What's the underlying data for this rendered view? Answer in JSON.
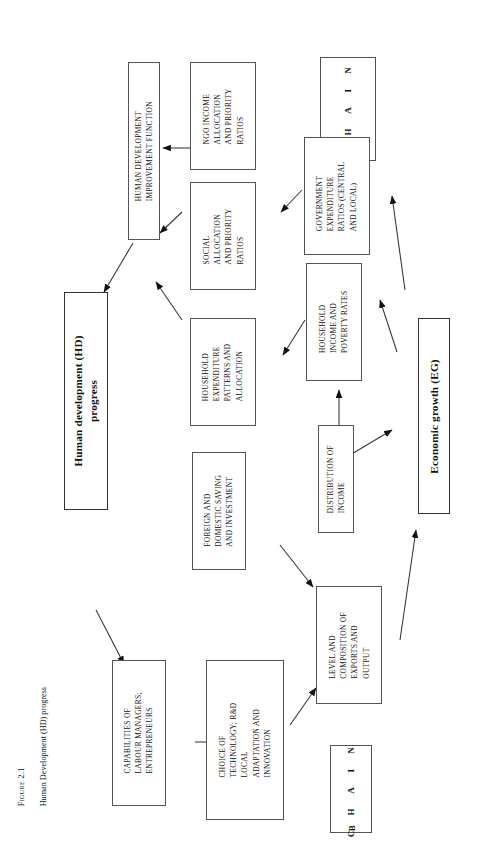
{
  "figure": {
    "label": "Figure 2.1",
    "caption": "Human Development (HD) progress"
  },
  "chains": [
    {
      "name": "chain-a",
      "label": "C H A I N",
      "letter": "A"
    },
    {
      "name": "chain-b",
      "label": "C H A I N",
      "letter": "B"
    }
  ],
  "nodes": {
    "hd_progress": "Human development (HD)\nprogress",
    "eg_growth": "Economic growth (EG)",
    "hd_improvement_function": "HUMAN DEVELOPMENT\nIMPROVEMENT FUNCTION",
    "ngo_income": "NGO INCOME\nALLOCATION\nAND PRIORITY\nRATIOS",
    "social_allocation": "SOCIAL\nALLOCATION\nAND PRIORITY\nRATIOS",
    "government_expenditure": "GOVERNMENT\nEXPENDITURE\nRATIOS (CENTRAL\nAND LOCAL)",
    "household_expenditure": "HOUSEHOLD\nEXPENDITURE\nPATTERNS AND\nALLOCATION",
    "household_income": "HOUSEHOLD\nINCOME AND\nPOVERTY RATES",
    "distribution_of_income": "DISTRIBUTION OF\nINCOME",
    "foreign_domestic_saving": "FOREIGN AND\nDOMESTIC SAVING\nAND INVESTMENT",
    "capabilities_labour": "CAPABILITIES OF\nLABOUR MANAGERS;\nENTREPRENEURS",
    "choice_of_technology": "CHOICE OF\nTECHNOLOGY; R&D\nLOCAL\nADAPTATION AND\nINNOVATION",
    "level_composition_exports": "LEVEL AND\nCOMPOSITION OF\nEXPORTS AND\nOUTPUT"
  },
  "colors": {
    "box_border": "#555555",
    "arrow": "#1a1a1a",
    "background": "#ffffff"
  }
}
